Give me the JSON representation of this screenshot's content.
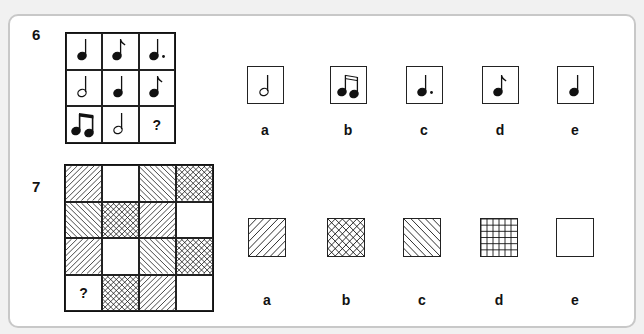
{
  "problems": [
    {
      "number": "6",
      "type": "music-notes-matrix",
      "grid": [
        [
          "quarter-note",
          "eighth-note",
          "dotted-quarter-note"
        ],
        [
          "half-note",
          "quarter-note",
          "eighth-note"
        ],
        [
          "beamed-eighth-notes",
          "half-note",
          "?"
        ]
      ],
      "options": [
        {
          "label": "a",
          "symbol": "half-note"
        },
        {
          "label": "b",
          "symbol": "beamed-sixteenth-notes"
        },
        {
          "label": "c",
          "symbol": "dotted-quarter-note"
        },
        {
          "label": "d",
          "symbol": "eighth-note"
        },
        {
          "label": "e",
          "symbol": "quarter-note"
        }
      ]
    },
    {
      "number": "7",
      "type": "hatch-pattern-matrix",
      "grid": [
        [
          "forward-diagonal",
          "blank",
          "back-diagonal",
          "crosshatch"
        ],
        [
          "back-diagonal",
          "crosshatch",
          "forward-diagonal",
          "blank"
        ],
        [
          "forward-diagonal",
          "blank",
          "back-diagonal",
          "crosshatch"
        ],
        [
          "?",
          "crosshatch",
          "forward-diagonal",
          "blank"
        ]
      ],
      "options": [
        {
          "label": "a",
          "pattern": "forward-diagonal"
        },
        {
          "label": "b",
          "pattern": "crosshatch"
        },
        {
          "label": "c",
          "pattern": "back-diagonal"
        },
        {
          "label": "d",
          "pattern": "grid"
        },
        {
          "label": "e",
          "pattern": "blank"
        }
      ]
    }
  ],
  "question_mark": "?"
}
